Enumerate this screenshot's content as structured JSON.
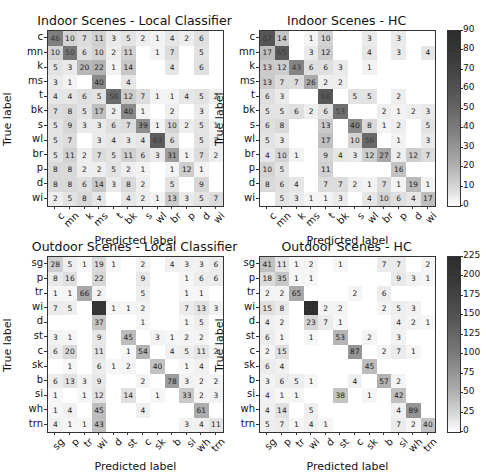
{
  "figure": {
    "xlabel": "Predicted label",
    "ylabel": "True label"
  },
  "chart_data": [
    {
      "type": "heatmap",
      "id": "indoor_local",
      "title": "Indoor Scenes - Local Classifier",
      "xlabel": "Predicted label",
      "ylabel": "True label",
      "labels": [
        "c",
        "mn",
        "k",
        "ms",
        "t",
        "bk",
        "s",
        "wl",
        "br",
        "p",
        "d",
        "wi"
      ],
      "colorbar": {
        "min": 0,
        "max": 90,
        "ticks": [
          0,
          10,
          20,
          30,
          40,
          50,
          60,
          70,
          80,
          90
        ]
      },
      "matrix": [
        [
          46,
          10,
          7,
          11,
          3,
          5,
          2,
          1,
          4,
          2,
          6,
          null
        ],
        [
          10,
          50,
          6,
          10,
          2,
          11,
          null,
          1,
          7,
          null,
          5,
          null
        ],
        [
          5,
          3,
          20,
          22,
          1,
          14,
          null,
          null,
          4,
          null,
          6,
          null
        ],
        [
          3,
          1,
          null,
          40,
          null,
          4,
          null,
          null,
          null,
          null,
          null,
          null
        ],
        [
          4,
          4,
          6,
          5,
          56,
          12,
          7,
          1,
          1,
          4,
          5,
          2
        ],
        [
          7,
          8,
          5,
          17,
          2,
          40,
          1,
          null,
          2,
          null,
          3,
          null
        ],
        [
          5,
          9,
          3,
          3,
          6,
          7,
          39,
          1,
          10,
          2,
          5,
          1
        ],
        [
          5,
          7,
          null,
          3,
          4,
          3,
          4,
          63,
          6,
          null,
          5,
          2
        ],
        [
          5,
          11,
          2,
          7,
          5,
          11,
          6,
          3,
          31,
          1,
          7,
          2
        ],
        [
          8,
          8,
          2,
          2,
          5,
          2,
          1,
          null,
          1,
          12,
          1,
          null
        ],
        [
          8,
          8,
          6,
          14,
          3,
          8,
          2,
          null,
          5,
          null,
          9,
          null
        ],
        [
          2,
          5,
          8,
          4,
          null,
          4,
          2,
          1,
          13,
          3,
          5,
          7
        ]
      ]
    },
    {
      "type": "heatmap",
      "id": "indoor_hc",
      "title": "Indoor Scenes - HC",
      "xlabel": "Predicted label",
      "ylabel": "True label",
      "labels": [
        "c",
        "mn",
        "k",
        "ms",
        "t",
        "bk",
        "s",
        "wl",
        "br",
        "p",
        "d",
        "wi"
      ],
      "colorbar": {
        "min": 0,
        "max": 90,
        "ticks": [
          0,
          10,
          20,
          30,
          40,
          50,
          60,
          70,
          80,
          90
        ]
      },
      "matrix": [
        [
          67,
          14,
          null,
          1,
          10,
          null,
          null,
          3,
          null,
          3,
          null,
          null
        ],
        [
          17,
          65,
          null,
          3,
          12,
          null,
          null,
          4,
          null,
          3,
          null,
          4
        ],
        [
          13,
          12,
          43,
          6,
          6,
          3,
          null,
          1,
          null,
          null,
          null,
          null
        ],
        [
          13,
          7,
          7,
          26,
          2,
          2,
          null,
          null,
          null,
          null,
          null,
          null
        ],
        [
          6,
          3,
          null,
          null,
          66,
          null,
          5,
          5,
          null,
          2,
          null,
          null
        ],
        [
          5,
          5,
          6,
          2,
          6,
          53,
          null,
          null,
          2,
          1,
          2,
          3
        ],
        [
          6,
          8,
          null,
          null,
          13,
          null,
          40,
          8,
          1,
          2,
          null,
          5
        ],
        [
          5,
          3,
          null,
          null,
          17,
          null,
          10,
          56,
          null,
          1,
          null,
          3
        ],
        [
          4,
          10,
          1,
          null,
          9,
          4,
          3,
          12,
          27,
          2,
          12,
          7
        ],
        [
          10,
          5,
          null,
          null,
          11,
          null,
          null,
          null,
          null,
          16,
          null,
          null
        ],
        [
          8,
          6,
          4,
          null,
          7,
          7,
          2,
          1,
          7,
          1,
          19,
          1
        ],
        [
          null,
          5,
          3,
          1,
          1,
          3,
          null,
          4,
          10,
          6,
          4,
          17
        ]
      ]
    },
    {
      "type": "heatmap",
      "id": "outdoor_local",
      "title": "Outdoor Scenes - Local Classifier",
      "xlabel": "Predicted label",
      "ylabel": "True label",
      "labels": [
        "sg",
        "p",
        "tr",
        "wi",
        "d",
        "st",
        "c",
        "sk",
        "b",
        "si",
        "wh",
        "trn"
      ],
      "colorbar": {
        "min": 0,
        "max": 225,
        "ticks": [
          0,
          25,
          50,
          75,
          100,
          125,
          150,
          175,
          200,
          225
        ]
      },
      "matrix": [
        [
          28,
          5,
          1,
          19,
          1,
          null,
          2,
          null,
          4,
          3,
          3,
          6
        ],
        [
          8,
          16,
          null,
          22,
          null,
          null,
          9,
          null,
          null,
          1,
          6,
          6
        ],
        [
          1,
          1,
          66,
          2,
          null,
          null,
          5,
          null,
          null,
          1,
          1,
          null
        ],
        [
          7,
          5,
          null,
          213,
          1,
          1,
          2,
          null,
          null,
          7,
          13,
          3
        ],
        [
          null,
          null,
          null,
          37,
          null,
          null,
          1,
          null,
          null,
          1,
          5,
          null
        ],
        [
          3,
          1,
          null,
          9,
          null,
          45,
          null,
          3,
          1,
          2,
          2,
          null
        ],
        [
          6,
          20,
          null,
          11,
          null,
          1,
          54,
          null,
          4,
          5,
          11,
          2
        ],
        [
          null,
          1,
          null,
          6,
          1,
          2,
          null,
          40,
          null,
          1,
          4,
          null
        ],
        [
          6,
          13,
          3,
          9,
          null,
          null,
          2,
          null,
          78,
          3,
          2,
          2
        ],
        [
          1,
          null,
          1,
          12,
          null,
          14,
          null,
          1,
          null,
          33,
          2,
          3
        ],
        [
          1,
          4,
          null,
          45,
          null,
          null,
          4,
          null,
          null,
          null,
          61,
          null
        ],
        [
          4,
          1,
          1,
          43,
          null,
          null,
          null,
          null,
          null,
          3,
          4,
          11
        ]
      ]
    },
    {
      "type": "heatmap",
      "id": "outdoor_hc",
      "title": "Outdoor Scenes - HC",
      "xlabel": "Predicted label",
      "ylabel": "True label",
      "labels": [
        "sg",
        "p",
        "tr",
        "wi",
        "d",
        "st",
        "c",
        "sk",
        "b",
        "si",
        "wh",
        "trn"
      ],
      "colorbar": {
        "min": 0,
        "max": 225,
        "ticks": [
          0,
          25,
          50,
          75,
          100,
          125,
          150,
          175,
          200,
          225
        ]
      },
      "matrix": [
        [
          41,
          11,
          1,
          2,
          null,
          1,
          null,
          null,
          7,
          7,
          null,
          2
        ],
        [
          18,
          35,
          1,
          1,
          null,
          null,
          null,
          null,
          null,
          9,
          3,
          1
        ],
        [
          2,
          2,
          65,
          null,
          null,
          null,
          2,
          null,
          6,
          null,
          null,
          null
        ],
        [
          15,
          8,
          null,
          225,
          2,
          2,
          null,
          null,
          2,
          5,
          3,
          null
        ],
        [
          4,
          2,
          null,
          23,
          7,
          1,
          null,
          null,
          null,
          4,
          2,
          1
        ],
        [
          6,
          1,
          null,
          1,
          null,
          53,
          null,
          2,
          null,
          3,
          null,
          null
        ],
        [
          2,
          15,
          null,
          null,
          null,
          null,
          87,
          null,
          2,
          7,
          1,
          null
        ],
        [
          6,
          4,
          null,
          null,
          null,
          null,
          null,
          45,
          null,
          null,
          null,
          null
        ],
        [
          3,
          6,
          5,
          1,
          null,
          null,
          4,
          null,
          57,
          2,
          null,
          null
        ],
        [
          4,
          1,
          1,
          null,
          null,
          38,
          null,
          1,
          null,
          42,
          null,
          null
        ],
        [
          4,
          14,
          null,
          5,
          null,
          null,
          null,
          null,
          null,
          4,
          89,
          null
        ],
        [
          5,
          7,
          1,
          4,
          1,
          null,
          null,
          null,
          null,
          7,
          2,
          40
        ]
      ]
    }
  ]
}
